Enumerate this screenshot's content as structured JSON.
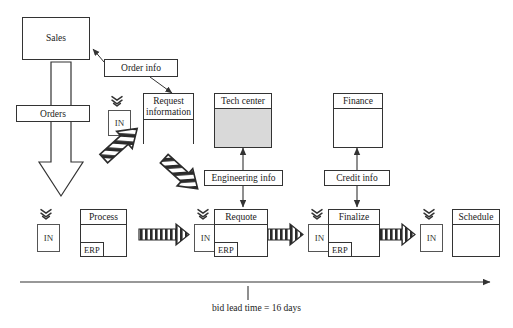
{
  "diagram": {
    "timeline": {
      "caption": "bid lead time = 16 days",
      "arrow_direction": "right"
    },
    "entities": {
      "sales": "Sales",
      "request_information": "Request\ninformation",
      "request_information_line1": "Request",
      "request_information_line2": "information",
      "tech_center": "Tech center",
      "finance": "Finance",
      "process": "Process",
      "requote": "Requote",
      "finalize": "Finalize",
      "schedule": "Schedule"
    },
    "flow_labels": {
      "orders": "Orders",
      "order_info": "Order info",
      "engineering_info": "Engineering info",
      "credit_info": "Credit info"
    },
    "system_chips": {
      "erp": "ERP"
    },
    "inventory_boxes": [
      {
        "label": "IN",
        "after": "orders"
      },
      {
        "label": "IN",
        "after": "request-information"
      },
      {
        "label": "IN",
        "after": "process"
      },
      {
        "label": "IN",
        "after": "requote"
      },
      {
        "label": "IN",
        "after": "finalize"
      }
    ],
    "process_steps": [
      {
        "name": "Process",
        "system": "ERP"
      },
      {
        "name": "Requote",
        "system": "ERP"
      },
      {
        "name": "Finalize",
        "system": "ERP"
      },
      {
        "name": "Schedule",
        "system": ""
      }
    ],
    "support_functions": [
      {
        "name": "Tech center",
        "shaded": true,
        "info_label": "Engineering info"
      },
      {
        "name": "Finance",
        "shaded": false,
        "info_label": "Credit info"
      }
    ],
    "colors": {
      "line": "#333333",
      "shade": "#d9d9d9",
      "background": "#ffffff",
      "text": "#1a1a1a"
    }
  }
}
